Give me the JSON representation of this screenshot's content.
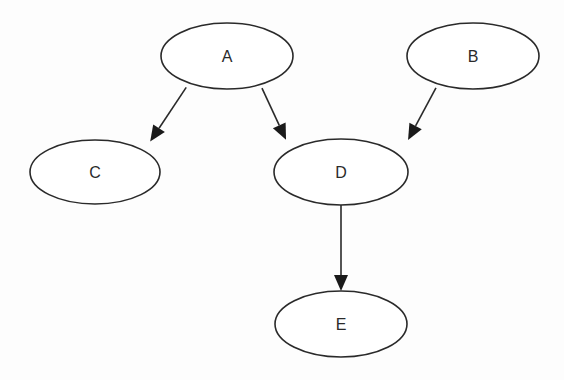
{
  "diagram": {
    "type": "directed-graph",
    "colors": {
      "background": "#fdfdfd",
      "stroke": "#2a2a2a",
      "node_fill": "#ffffff",
      "text": "#2a2a2a"
    },
    "nodes": [
      {
        "id": "A",
        "label": "A"
      },
      {
        "id": "B",
        "label": "B"
      },
      {
        "id": "C",
        "label": "C"
      },
      {
        "id": "D",
        "label": "D"
      },
      {
        "id": "E",
        "label": "E"
      }
    ],
    "edges": [
      {
        "from": "A",
        "to": "C"
      },
      {
        "from": "A",
        "to": "D"
      },
      {
        "from": "B",
        "to": "D"
      },
      {
        "from": "D",
        "to": "E"
      }
    ]
  }
}
